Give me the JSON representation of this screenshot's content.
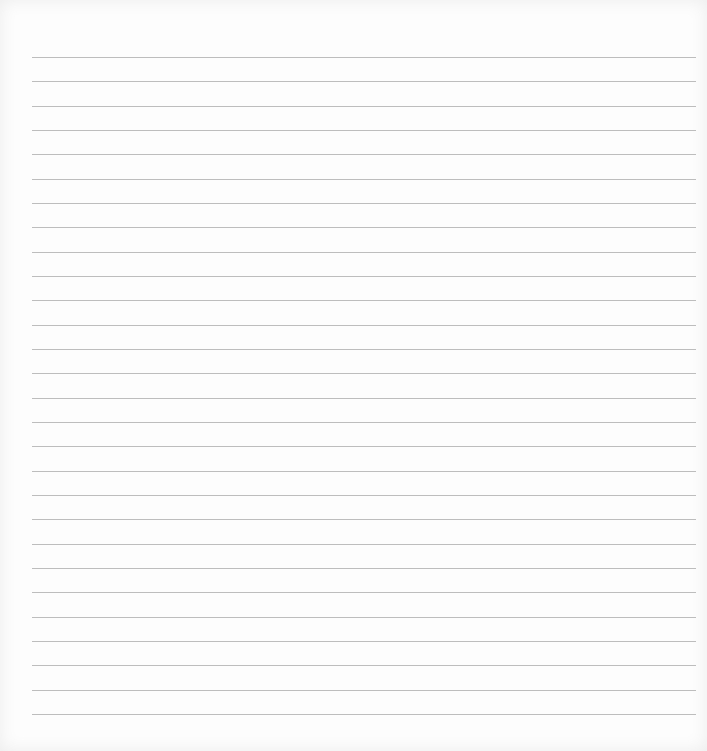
{
  "page": {
    "type": "lined-paper",
    "background_color": "#fdfdfd",
    "line_color": "#bdbdbd",
    "line_count": 28,
    "first_line_y": 57,
    "line_spacing": 24.33,
    "line_left": 32,
    "line_right": 696
  }
}
